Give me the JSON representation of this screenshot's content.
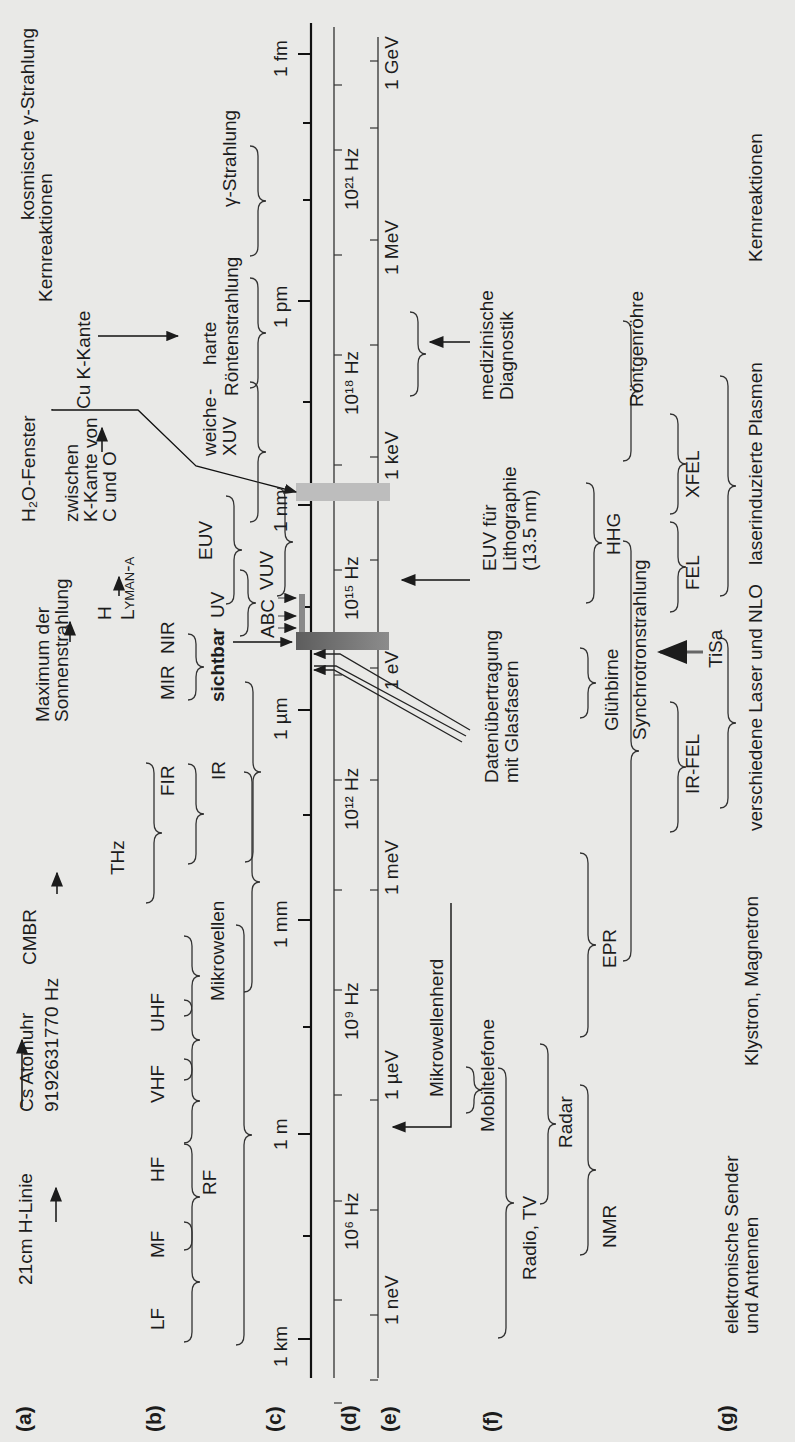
{
  "figure": {
    "orientation": "rotated -90deg (frequency increases upward)",
    "row_labels": [
      "(a)",
      "(b)",
      "(c)",
      "(d)",
      "(e)",
      "(f)",
      "(g)"
    ]
  },
  "row_a": {
    "items": [
      {
        "label": "21cm H-Linie"
      },
      {
        "label": "Cs Atomuhr",
        "sub": "9192631770 Hz"
      },
      {
        "label": "CMBR"
      },
      {
        "label": "Maximum der",
        "label2": "Sonnenstrahlung"
      },
      {
        "label": "H",
        "label2": "Lyman-α"
      },
      {
        "label": "H₂O-Fenster"
      },
      {
        "label": "zwischen",
        "label2": "K-Kante von",
        "label3": "C und O"
      },
      {
        "label": "Cu K-Kante"
      },
      {
        "label": "Kernreaktionen"
      },
      {
        "label": "kosmische γ-Strahlung"
      }
    ]
  },
  "row_b": {
    "bands": [
      "LF",
      "MF",
      "HF",
      "VHF",
      "UHF",
      "RF",
      "Mikrowellen",
      "THz",
      "FIR",
      "IR",
      "MIR",
      "NIR",
      "sichtbar",
      "UV",
      "ABC",
      "VUV",
      "EUV",
      "weiche",
      "XUV",
      "-",
      "harte",
      "Röntenstrahlung",
      "γ-Strahlung"
    ]
  },
  "axis_c": {
    "name": "Wellenlänge",
    "ticks": [
      "1 km",
      "1 m",
      "1 mm",
      "1 µm",
      "1 nm",
      "1 pm",
      "1 fm"
    ]
  },
  "axis_d": {
    "name": "Frequenz",
    "ticks": [
      "10⁶ Hz",
      "10⁹ Hz",
      "10¹² Hz",
      "10¹⁵ Hz",
      "10¹⁸ Hz",
      "10²¹ Hz"
    ]
  },
  "axis_e": {
    "name": "Photonenenergie",
    "ticks": [
      "1 neV",
      "1 µeV",
      "1 meV",
      "1 eV",
      "1 keV",
      "1 MeV",
      "1 GeV"
    ]
  },
  "row_f": {
    "items": [
      "Radio, TV",
      "Mobiltelefone",
      "Mikrowellenherd",
      "Radar",
      "NMR",
      "EPR",
      "Datenübertragung",
      "mit Glasfasern",
      "Glühbirne",
      "EUV für",
      "Lithographie",
      "(13.5 nm)",
      "HHG",
      "medizinische",
      "Diagnostik"
    ]
  },
  "row_g": {
    "items": [
      "elektronische Sender",
      "und Antennen",
      "Klystron, Magnetron",
      "Synchrotronstrahlung",
      "Röntgenröhre",
      "IR-FEL",
      "FEL",
      "XFEL",
      "TiSa",
      "verschiedene Laser und NLO",
      "laserinduzierte Plasmen",
      "Kernreaktionen"
    ]
  },
  "colors": {
    "background": "#e9e9e7",
    "ink": "#1c1c1c",
    "visible_band": "#6f6f6f",
    "water_window": "#b9b9b9"
  }
}
